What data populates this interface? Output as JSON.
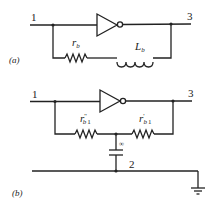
{
  "diagram": {
    "type": "circuit-schematic",
    "background": "#ffffff",
    "ink_color": "#222222",
    "part_a": {
      "panel_label": "(a)",
      "node_labels": {
        "input": "1",
        "output": "3"
      },
      "components": [
        {
          "kind": "inverter-buffer",
          "name": "gain-element"
        },
        {
          "kind": "resistor",
          "symbol": "r",
          "subscript": "b"
        },
        {
          "kind": "inductor",
          "symbol": "L",
          "subscript": "b"
        }
      ],
      "connections": "Inverter between node 1 and node 3; series r_b and L_b feedback path in parallel from node 1 to node 3"
    },
    "part_b": {
      "panel_label": "(b)",
      "node_labels": {
        "input": "1",
        "output": "3",
        "common": "2"
      },
      "components": [
        {
          "kind": "inverter-buffer",
          "name": "gain-element"
        },
        {
          "kind": "resistor",
          "symbol": "r",
          "primes": "''",
          "subscript": "b",
          "subscript_index": "1"
        },
        {
          "kind": "resistor",
          "symbol": "r",
          "primes": "'",
          "subscript": "b",
          "subscript_index": "1"
        },
        {
          "kind": "capacitor",
          "value_label": "∞"
        },
        {
          "kind": "ground"
        }
      ],
      "connections": "Inverter between node 1 and node 3; r''_b1 and r'_b1 in series from node 1 to node 3; midpoint to node 2 through capacitor ∞; node 2 line grounded"
    }
  }
}
